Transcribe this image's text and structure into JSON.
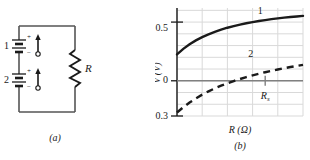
{
  "figure": {
    "panel_a": {
      "caption": "(a)",
      "source_labels": [
        "1",
        "2"
      ],
      "resistor_label": "R",
      "polarity_plus": "+",
      "polarity_minus": "−",
      "icon_names": [
        "battery-cell-icon",
        "emf-arrow-icon",
        "resistor-zigzag-icon"
      ]
    },
    "panel_b": {
      "caption": "(b)",
      "ylabel": "V (V)",
      "xlabel": "R (Ω)",
      "ytick_labels": [
        "0.5",
        "0",
        "−0.3"
      ],
      "curve_labels": [
        "1",
        "2"
      ],
      "annotation_label": "R",
      "annotation_sub": "s"
    }
  },
  "colors": {
    "ink": "#1a1a1a",
    "grid": "#d9d9d9",
    "zero_line": "#808080",
    "wire": "#555555"
  },
  "chart_data": {
    "type": "line",
    "title": "",
    "xlabel": "R (Ω)",
    "ylabel": "V (V)",
    "xlim": [
      0,
      10
    ],
    "ylim": [
      -0.3,
      0.62
    ],
    "ytick_values": [
      0.5,
      0,
      -0.3
    ],
    "xtick_values": [],
    "grid": true,
    "legend": "inline-curve-labels",
    "annotations": [
      {
        "label": "R_s",
        "x": 7.0,
        "y": 0,
        "note": "tick on zero axis"
      }
    ],
    "series": [
      {
        "name": "1",
        "style": "solid",
        "label_x": 6.6,
        "label_y": 0.565,
        "x": [
          0,
          0.5,
          1,
          1.5,
          2,
          2.5,
          3,
          3.5,
          4,
          4.5,
          5,
          5.5,
          6,
          6.5,
          7,
          7.5,
          8,
          8.5,
          9,
          9.5,
          10
        ],
        "y": [
          0.225,
          0.272,
          0.311,
          0.344,
          0.372,
          0.396,
          0.417,
          0.436,
          0.452,
          0.466,
          0.479,
          0.49,
          0.5,
          0.509,
          0.517,
          0.525,
          0.532,
          0.538,
          0.543,
          0.548,
          0.553
        ]
      },
      {
        "name": "2",
        "style": "dashed",
        "label_x": 5.85,
        "label_y": 0.205,
        "x": [
          0,
          0.5,
          1,
          1.5,
          2,
          2.5,
          3,
          3.5,
          4,
          4.5,
          5,
          5.5,
          6,
          6.5,
          7,
          7.5,
          8,
          8.5,
          9,
          9.5,
          10
        ],
        "y": [
          -0.27,
          -0.225,
          -0.185,
          -0.15,
          -0.118,
          -0.09,
          -0.065,
          -0.042,
          -0.021,
          -0.002,
          0.015,
          0.031,
          0.046,
          0.06,
          0.073,
          0.085,
          0.096,
          0.107,
          0.117,
          0.126,
          0.135
        ]
      }
    ]
  }
}
